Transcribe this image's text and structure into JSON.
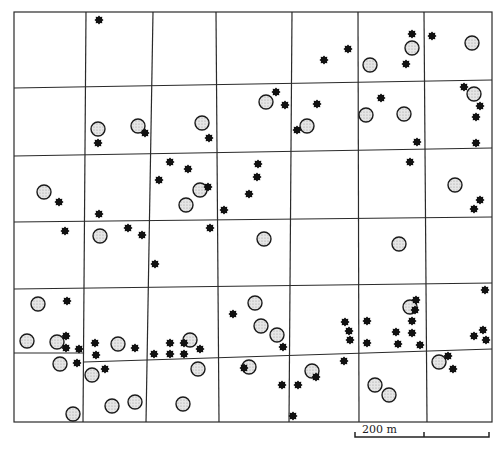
{
  "map": {
    "title": "",
    "colors": {
      "ink": "#1a1a1a",
      "site_fill": "#d9d9d9",
      "background": "#ffffff"
    },
    "frame": {
      "left": 14,
      "top": 12,
      "right": 492,
      "bottom": 422
    },
    "vertical_lines": [
      {
        "x1": 86,
        "y1": 12,
        "x2": 83,
        "y2": 422
      },
      {
        "x1": 153,
        "y1": 12,
        "x2": 146,
        "y2": 422
      },
      {
        "x1": 216,
        "y1": 12,
        "x2": 219,
        "y2": 422
      },
      {
        "x1": 292,
        "y1": 12,
        "x2": 289,
        "y2": 422
      },
      {
        "x1": 358,
        "y1": 12,
        "x2": 359,
        "y2": 422
      },
      {
        "x1": 424,
        "y1": 12,
        "x2": 427,
        "y2": 422
      }
    ],
    "horizontal_lines": [
      {
        "x1": 14,
        "y1": 88,
        "x2": 492,
        "y2": 80
      },
      {
        "x1": 14,
        "y1": 156,
        "x2": 492,
        "y2": 148
      },
      {
        "x1": 14,
        "y1": 222,
        "x2": 492,
        "y2": 217
      },
      {
        "x1": 14,
        "y1": 289,
        "x2": 492,
        "y2": 283
      },
      {
        "x1": 14,
        "y1": 353,
        "x2": 84,
        "y2": 353
      },
      {
        "x1": 84,
        "y1": 362,
        "x2": 492,
        "y2": 349
      }
    ],
    "legend_symbols": {
      "site": "open-stippled-circle",
      "findspot": "black-star"
    },
    "sites": [
      [
        98,
        129
      ],
      [
        138,
        126
      ],
      [
        202,
        123
      ],
      [
        266,
        102
      ],
      [
        307,
        126
      ],
      [
        370,
        65
      ],
      [
        412,
        48
      ],
      [
        472,
        43
      ],
      [
        474,
        94
      ],
      [
        366,
        115
      ],
      [
        404,
        114
      ],
      [
        44,
        192
      ],
      [
        200,
        190
      ],
      [
        186,
        205
      ],
      [
        455,
        185
      ],
      [
        100,
        236
      ],
      [
        264,
        239
      ],
      [
        399,
        244
      ],
      [
        38,
        304
      ],
      [
        27,
        341
      ],
      [
        57,
        342
      ],
      [
        60,
        364
      ],
      [
        92,
        375
      ],
      [
        118,
        344
      ],
      [
        190,
        340
      ],
      [
        198,
        369
      ],
      [
        255,
        303
      ],
      [
        261,
        326
      ],
      [
        277,
        335
      ],
      [
        249,
        367
      ],
      [
        312,
        371
      ],
      [
        375,
        385
      ],
      [
        389,
        395
      ],
      [
        410,
        307
      ],
      [
        439,
        362
      ],
      [
        73,
        414
      ],
      [
        112,
        406
      ],
      [
        135,
        402
      ],
      [
        183,
        404
      ]
    ],
    "findspots": [
      [
        99,
        20
      ],
      [
        98,
        143
      ],
      [
        145,
        133
      ],
      [
        209,
        138
      ],
      [
        276,
        92
      ],
      [
        285,
        105
      ],
      [
        297,
        130
      ],
      [
        317,
        104
      ],
      [
        324,
        60
      ],
      [
        348,
        49
      ],
      [
        412,
        34
      ],
      [
        432,
        36
      ],
      [
        406,
        64
      ],
      [
        381,
        98
      ],
      [
        417,
        142
      ],
      [
        464,
        87
      ],
      [
        480,
        106
      ],
      [
        476,
        117
      ],
      [
        476,
        143
      ],
      [
        170,
        162
      ],
      [
        188,
        169
      ],
      [
        159,
        180
      ],
      [
        208,
        187
      ],
      [
        258,
        164
      ],
      [
        257,
        177
      ],
      [
        249,
        194
      ],
      [
        224,
        210
      ],
      [
        410,
        162
      ],
      [
        480,
        200
      ],
      [
        474,
        209
      ],
      [
        59,
        202
      ],
      [
        99,
        214
      ],
      [
        65,
        231
      ],
      [
        128,
        228
      ],
      [
        142,
        235
      ],
      [
        210,
        228
      ],
      [
        155,
        264
      ],
      [
        67,
        301
      ],
      [
        66,
        336
      ],
      [
        66,
        348
      ],
      [
        79,
        349
      ],
      [
        77,
        363
      ],
      [
        95,
        343
      ],
      [
        96,
        355
      ],
      [
        105,
        369
      ],
      [
        135,
        348
      ],
      [
        154,
        354
      ],
      [
        170,
        343
      ],
      [
        170,
        354
      ],
      [
        184,
        343
      ],
      [
        184,
        354
      ],
      [
        200,
        349
      ],
      [
        233,
        314
      ],
      [
        283,
        347
      ],
      [
        244,
        368
      ],
      [
        298,
        385
      ],
      [
        345,
        322
      ],
      [
        349,
        331
      ],
      [
        350,
        340
      ],
      [
        344,
        361
      ],
      [
        367,
        321
      ],
      [
        367,
        343
      ],
      [
        396,
        332
      ],
      [
        412,
        321
      ],
      [
        416,
        300
      ],
      [
        415,
        310
      ],
      [
        412,
        333
      ],
      [
        420,
        345
      ],
      [
        398,
        344
      ],
      [
        485,
        290
      ],
      [
        483,
        330
      ],
      [
        474,
        336
      ],
      [
        486,
        340
      ],
      [
        448,
        356
      ],
      [
        453,
        369
      ],
      [
        282,
        385
      ],
      [
        316,
        377
      ],
      [
        293,
        416
      ]
    ],
    "scale_bar": {
      "label": "200 m",
      "x_start": 355,
      "x_mid": 424,
      "x_end": 489,
      "y": 437
    }
  }
}
